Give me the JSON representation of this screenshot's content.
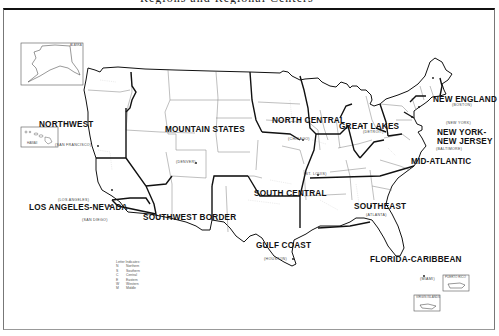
{
  "title": "Regions and Regional Centers",
  "regions": [
    {
      "id": "new-england",
      "label": "NEW ENGLAND",
      "center": "(BOSTON)"
    },
    {
      "id": "new-york-new-jersey",
      "label_line1": "NEW YORK-",
      "label_line2": "NEW JERSEY",
      "center": "(NEW YORK)"
    },
    {
      "id": "mid-atlantic",
      "label": "MID-ATLANTIC",
      "center": "(BALTIMORE)"
    },
    {
      "id": "southeast",
      "label": "SOUTHEAST",
      "center": "(ATLANTA)"
    },
    {
      "id": "florida-caribbean",
      "label": "FLORIDA-CARIBBEAN",
      "center": "(MIAMI)"
    },
    {
      "id": "great-lakes",
      "label": "GREAT LAKES",
      "center": "(DETROIT)"
    },
    {
      "id": "north-central",
      "label": "NORTH CENTRAL",
      "center": "(CHICAGO)"
    },
    {
      "id": "south-central",
      "label": "SOUTH CENTRAL",
      "center": "(ST. LOUIS)"
    },
    {
      "id": "gulf-coast",
      "label": "GULF COAST",
      "center": "(HOUSTON)"
    },
    {
      "id": "mountain-states",
      "label": "MOUNTAIN STATES",
      "center": "(DENVER)"
    },
    {
      "id": "southwest-border",
      "label": "SOUTHWEST BORDER",
      "center": "(SAN DIEGO)"
    },
    {
      "id": "los-angeles-nevada",
      "label": "LOS ANGELES-NEVADA",
      "center": "(LOS ANGELES)"
    },
    {
      "id": "northwest",
      "label": "NORTHWEST",
      "center": "(SAN FRANCISCO)"
    }
  ],
  "insets": {
    "alaska": "ALASKA",
    "hawaii": "HAWAII",
    "puerto_rico": "PUERTO RICO",
    "virgin_islands": "VIRGIN ISLANDS"
  },
  "legend": {
    "title": "Letter Indicates:",
    "items": [
      {
        "key": "N",
        "value": "Northern"
      },
      {
        "key": "S",
        "value": "Southern"
      },
      {
        "key": "C",
        "value": "Central"
      },
      {
        "key": "E",
        "value": "Eastern"
      },
      {
        "key": "W",
        "value": "Western"
      },
      {
        "key": "M",
        "value": "Middle"
      }
    ]
  },
  "colors": {
    "ink": "#111111",
    "state_border": "#8a8a8a",
    "district_border": "#c8c8c8",
    "background": "#ffffff"
  }
}
